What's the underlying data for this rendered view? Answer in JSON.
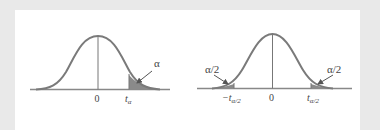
{
  "colors": {
    "background": "#e9e9e9",
    "panel": "#ffffff",
    "curve": "#7a7a7a",
    "axis": "#888888",
    "shade": "#8a8a8a",
    "text": "#444444"
  },
  "left_diagram": {
    "title": "One-tailed t distribution",
    "center_label": "0",
    "critical_label_base": "t",
    "critical_label_sub": "α",
    "area_label": "α"
  },
  "right_diagram": {
    "title": "Two-tailed t distribution",
    "center_label": "0",
    "left_critical_label_base": "−t",
    "left_critical_label_sub": "α/2",
    "right_critical_label_base": "t",
    "right_critical_label_sub": "α/2",
    "left_area_label": "α/2",
    "right_area_label": "α/2"
  }
}
